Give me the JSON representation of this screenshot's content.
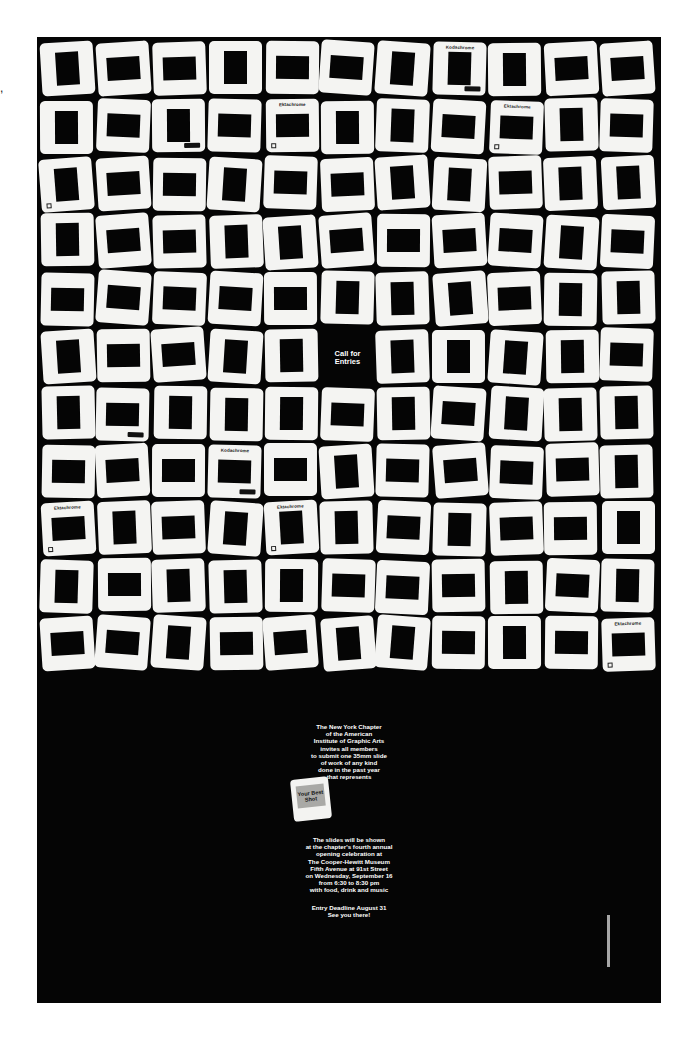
{
  "poster": {
    "background": "#050505",
    "slide_color": "#f4f4f2",
    "grid": {
      "rows": 11,
      "cols": 11,
      "empty_cell": {
        "row": 5,
        "col": 5
      }
    },
    "call_for_entries": [
      "Call for",
      "Entries"
    ],
    "labeled_slides": [
      {
        "row": 0,
        "col": 7,
        "brand": "Kodachrome",
        "kodak_tag": true
      },
      {
        "row": 1,
        "col": 2,
        "brand": "",
        "kodak_tag": true
      },
      {
        "row": 1,
        "col": 4,
        "brand": "Ektachrome",
        "k_logo": true
      },
      {
        "row": 1,
        "col": 8,
        "brand": "Ektachrome",
        "k_logo": true
      },
      {
        "row": 2,
        "col": 0,
        "brand": "",
        "k_logo": true
      },
      {
        "row": 6,
        "col": 1,
        "brand": "",
        "kodak_tag": true
      },
      {
        "row": 7,
        "col": 3,
        "brand": "Kodachrome",
        "kodak_tag": true
      },
      {
        "row": 8,
        "col": 0,
        "brand": "Ektachrome",
        "k_logo": true
      },
      {
        "row": 8,
        "col": 4,
        "brand": "Ektachrome",
        "k_logo": true
      },
      {
        "row": 10,
        "col": 10,
        "brand": "Ektachrome",
        "k_logo": true
      }
    ],
    "invitation_lines": [
      "The New York Chapter",
      "of the American",
      "Institute of Graphic Arts",
      "invites all members",
      "to submit one 35mm slide",
      "of work of any kind",
      "done in the past year",
      "that represents"
    ],
    "best_shot_label": "Your Best Shot",
    "details_lines": [
      "The slides will be shown",
      "at the chapter's fourth annual",
      "opening celebration at",
      "The Cooper-Hewitt Museum",
      "Fifth Avenue at 91st Street",
      "on Wednesday, September 16",
      "from 6:30 to 8:30 pm",
      "with food, drink and music"
    ],
    "deadline_lines": [
      "Entry Deadline August 31",
      "See you there!"
    ]
  },
  "corner_mark": ","
}
